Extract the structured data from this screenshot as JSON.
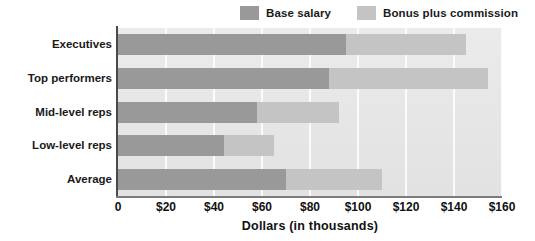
{
  "chart_data": {
    "type": "bar",
    "orientation": "horizontal",
    "stacked": true,
    "title": "",
    "subtitle": "",
    "xlabel": "Dollars (in thousands)",
    "ylabel": "",
    "xlim": [
      0,
      160
    ],
    "xtick_labels": [
      "0",
      "$20",
      "$40",
      "$60",
      "$80",
      "$100",
      "$120",
      "$140",
      "$160"
    ],
    "xtick_values": [
      0,
      20,
      40,
      60,
      80,
      100,
      120,
      140,
      160
    ],
    "grid": true,
    "grid_axis": "x",
    "legend_position": "top-right",
    "categories": [
      "Executives",
      "Top performers",
      "Mid-level reps",
      "Low-level reps",
      "Average"
    ],
    "series": [
      {
        "name": "Base salary",
        "color": "#999999",
        "values": [
          95,
          88,
          58,
          44,
          70
        ]
      },
      {
        "name": "Bonus plus commission",
        "color": "#c4c4c4",
        "values": [
          50,
          66,
          34,
          21,
          40
        ]
      }
    ],
    "totals": [
      145,
      154,
      92,
      65,
      110
    ]
  },
  "legend": {
    "entries": [
      {
        "label": "Base salary",
        "color": "#999999"
      },
      {
        "label": "Bonus plus commission",
        "color": "#c4c4c4"
      }
    ]
  },
  "axis": {
    "x_title": "Dollars (in thousands)"
  },
  "colors": {
    "base_salary": "#999999",
    "bonus_commission": "#c4c4c4",
    "plot_background": "#e8e8e8",
    "gridline": "#fbfbfb",
    "axis_line": "#4a4a4a",
    "text": "#1a1a1a"
  }
}
